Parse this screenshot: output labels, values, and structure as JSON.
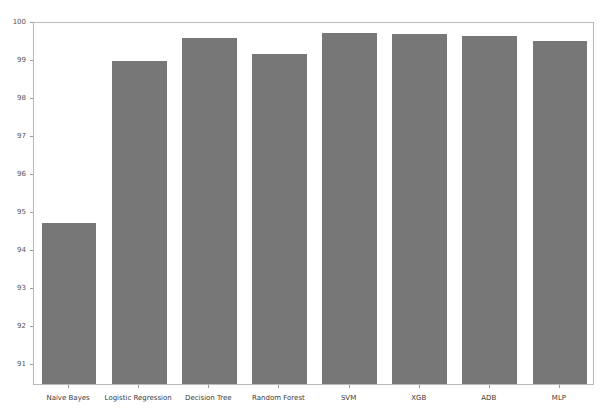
{
  "chart_data": {
    "type": "bar",
    "title": "",
    "subtitle": "",
    "xlabel": "",
    "ylabel": "",
    "categories": [
      "Naive Bayes",
      "Logistic Regression",
      "Decision Tree",
      "Random Forest",
      "SVM",
      "XGB",
      "ADB",
      "MLP"
    ],
    "values": [
      94.68,
      98.95,
      99.56,
      99.13,
      99.68,
      99.66,
      99.61,
      99.48
    ],
    "series": [
      {
        "name": "Accuracy",
        "values": [
          94.68,
          98.95,
          99.56,
          99.13,
          99.68,
          99.66,
          99.61,
          99.48
        ]
      }
    ],
    "ylim": [
      90.45,
      100.0
    ],
    "yticks": [
      91,
      92,
      93,
      94,
      95,
      96,
      97,
      98,
      99,
      100
    ],
    "ytick_labels": [
      "91",
      "92",
      "93",
      "94",
      "95",
      "96",
      "97",
      "98",
      "99",
      "100"
    ],
    "xtick_labels": [
      "Naive Bayes",
      "Logistic Regression",
      "Decision Tree",
      "Random Forest",
      "SVM",
      "XGB",
      "ADB",
      "MLP"
    ],
    "grid": false,
    "legend": null,
    "legend_position": "none",
    "bar_color": "#777777",
    "frame_color": "#b9b9b9",
    "background_color": "#ffffff",
    "annotations": []
  },
  "figure": {
    "plot_frame_visible": true,
    "axis_label_color": "#555555",
    "tick_label_color": "#3a3a3a"
  }
}
